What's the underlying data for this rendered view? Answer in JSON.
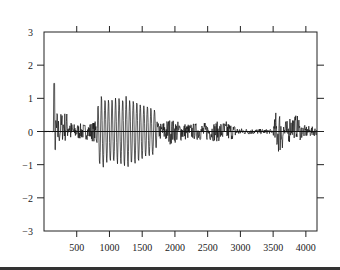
{
  "chart_data": {
    "type": "line",
    "title": "",
    "xlabel": "",
    "ylabel": "",
    "xlim": [
      0,
      4170
    ],
    "ylim": [
      -3,
      3
    ],
    "x_ticks": [
      500,
      1000,
      1500,
      2000,
      2500,
      3000,
      3500,
      4000
    ],
    "x_tick_labels": [
      "500",
      "1000",
      "1500",
      "2000",
      "2500",
      "3000",
      "3500",
      "4000"
    ],
    "y_ticks": [
      3,
      2,
      1,
      0,
      -1,
      -2,
      -3
    ],
    "y_tick_labels": [
      "3",
      "2",
      "1",
      "0",
      "−1",
      "−2",
      "−3"
    ],
    "grid": false,
    "legend": null,
    "baseline": 0,
    "series": [
      {
        "name": "signal",
        "color": "#111111",
        "description": "Oscillating waveform; spike near x=160 (~1.5), high-amplitude burst 820-1700 (~±1.1), moderate noise 1750-3000 (~±0.4), quiet 3000-3500, second burst near 3550-3650 (~0.85), tail to 4170",
        "envelope": [
          {
            "x": 0,
            "amp": 0.02
          },
          {
            "x": 150,
            "amp": 0.02
          },
          {
            "x": 160,
            "amp": 1.5
          },
          {
            "x": 190,
            "amp": 0.9
          },
          {
            "x": 230,
            "amp": 0.5
          },
          {
            "x": 330,
            "amp": 0.6
          },
          {
            "x": 450,
            "amp": 0.3
          },
          {
            "x": 650,
            "amp": 0.3
          },
          {
            "x": 780,
            "amp": 0.4
          },
          {
            "x": 850,
            "amp": 1.15
          },
          {
            "x": 1000,
            "amp": 1.0
          },
          {
            "x": 1300,
            "amp": 1.1
          },
          {
            "x": 1500,
            "amp": 0.9
          },
          {
            "x": 1700,
            "amp": 0.7
          },
          {
            "x": 1750,
            "amp": 0.3
          },
          {
            "x": 1900,
            "amp": 0.5
          },
          {
            "x": 2200,
            "amp": 0.3
          },
          {
            "x": 2800,
            "amp": 0.4
          },
          {
            "x": 3000,
            "amp": 0.12
          },
          {
            "x": 3500,
            "amp": 0.08
          },
          {
            "x": 3540,
            "amp": 0.8
          },
          {
            "x": 3620,
            "amp": 0.85
          },
          {
            "x": 3700,
            "amp": 0.4
          },
          {
            "x": 3850,
            "amp": 0.45
          },
          {
            "x": 3950,
            "amp": 0.25
          },
          {
            "x": 4170,
            "amp": 0.15
          }
        ]
      }
    ]
  }
}
